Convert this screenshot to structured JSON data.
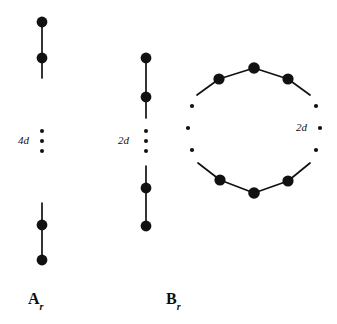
{
  "figure": {
    "background_color": "#ffffff",
    "ink_color": "#111111",
    "node_color": "#111111",
    "width": 337,
    "height": 324,
    "diagrams": [
      {
        "id": "A_r",
        "caption": "A",
        "caption_subscript": "r",
        "caption_x": 42,
        "caption_y": 300,
        "multiplicity_label": "4d",
        "multiplicity_label_x": 18,
        "multiplicity_label_y": 141,
        "axis_x": 42,
        "shape": "vertical-chain",
        "nodes": [
          {
            "cx": 42,
            "cy": 22,
            "r": 5.4
          },
          {
            "cx": 42,
            "cy": 58,
            "r": 5.4
          },
          {
            "cx": 42,
            "cy": 225,
            "r": 5.4
          },
          {
            "cx": 42,
            "cy": 260,
            "r": 5.4
          }
        ],
        "edges": [
          {
            "x1": 42,
            "y1": 22,
            "x2": 42,
            "y2": 58
          },
          {
            "x1": 42,
            "y1": 58,
            "x2": 42,
            "y2": 78
          },
          {
            "x1": 42,
            "y1": 203,
            "x2": 42,
            "y2": 225
          },
          {
            "x1": 42,
            "y1": 225,
            "x2": 42,
            "y2": 260
          }
        ],
        "ellipsis_dots": [
          {
            "cx": 42,
            "cy": 131,
            "r": 2.0
          },
          {
            "cx": 42,
            "cy": 141,
            "r": 2.0
          },
          {
            "cx": 42,
            "cy": 151,
            "r": 2.0
          }
        ]
      },
      {
        "id": "B_r",
        "caption": "B",
        "caption_subscript": "r",
        "caption_x": 180,
        "caption_y": 300,
        "multiplicity_label": "2d",
        "multiplicity_label_x": 118,
        "multiplicity_label_y": 141,
        "axis_x": 146,
        "shape": "vertical-chain",
        "nodes": [
          {
            "cx": 146,
            "cy": 58,
            "r": 5.4
          },
          {
            "cx": 146,
            "cy": 97,
            "r": 5.4
          },
          {
            "cx": 146,
            "cy": 188,
            "r": 5.4
          },
          {
            "cx": 146,
            "cy": 226,
            "r": 5.4
          }
        ],
        "edges": [
          {
            "x1": 146,
            "y1": 58,
            "x2": 146,
            "y2": 97
          },
          {
            "x1": 146,
            "y1": 97,
            "x2": 146,
            "y2": 118
          },
          {
            "x1": 146,
            "y1": 166,
            "x2": 146,
            "y2": 188
          },
          {
            "x1": 146,
            "y1": 188,
            "x2": 146,
            "y2": 226
          }
        ],
        "ellipsis_dots": [
          {
            "cx": 146,
            "cy": 131,
            "r": 2.0
          },
          {
            "cx": 146,
            "cy": 141,
            "r": 2.0
          },
          {
            "cx": 146,
            "cy": 151,
            "r": 2.0
          }
        ]
      },
      {
        "id": "cycle",
        "caption": "",
        "caption_subscript": "",
        "multiplicity_label": "2d",
        "multiplicity_label_x": 296,
        "multiplicity_label_y": 128,
        "shape": "cycle",
        "center_x": 254,
        "center_y": 128,
        "radius": 64,
        "nodes": [
          {
            "cx": 219,
            "cy": 79,
            "r": 5.6
          },
          {
            "cx": 254,
            "cy": 68,
            "r": 5.8
          },
          {
            "cx": 288,
            "cy": 79,
            "r": 5.6
          },
          {
            "cx": 288,
            "cy": 181,
            "r": 5.6
          },
          {
            "cx": 254,
            "cy": 193,
            "r": 5.8
          },
          {
            "cx": 220,
            "cy": 180,
            "r": 5.6
          }
        ],
        "edges": [
          {
            "x1": 219,
            "y1": 79,
            "x2": 254,
            "y2": 68
          },
          {
            "x1": 254,
            "y1": 68,
            "x2": 288,
            "y2": 79
          },
          {
            "x1": 219,
            "y1": 79,
            "x2": 197,
            "y2": 95
          },
          {
            "x1": 288,
            "y1": 79,
            "x2": 310,
            "y2": 95
          },
          {
            "x1": 220,
            "y1": 180,
            "x2": 254,
            "y2": 193
          },
          {
            "x1": 254,
            "y1": 193,
            "x2": 288,
            "y2": 181
          },
          {
            "x1": 220,
            "y1": 180,
            "x2": 198,
            "y2": 163
          },
          {
            "x1": 288,
            "y1": 181,
            "x2": 310,
            "y2": 163
          }
        ],
        "ellipsis_dots": [
          {
            "cx": 192,
            "cy": 106,
            "r": 2.1
          },
          {
            "cx": 188,
            "cy": 128,
            "r": 2.1
          },
          {
            "cx": 192,
            "cy": 150,
            "r": 2.1
          },
          {
            "cx": 316,
            "cy": 106,
            "r": 2.1
          },
          {
            "cx": 320,
            "cy": 128,
            "r": 2.1
          },
          {
            "cx": 316,
            "cy": 150,
            "r": 2.1
          }
        ]
      }
    ]
  }
}
